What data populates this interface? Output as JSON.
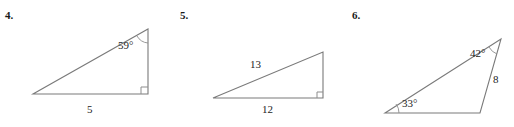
{
  "page": {
    "background_color": "#ffffff",
    "stroke_color": "#7a7a7a",
    "text_color": "#242424"
  },
  "problems": [
    {
      "number": "4.",
      "figure": {
        "shape": "right-triangle",
        "vertices": {
          "bottom_left": [
            33,
            94
          ],
          "bottom_right": [
            148,
            94
          ],
          "top_right": [
            148,
            29
          ]
        },
        "right_angle_at": "bottom_right",
        "labels": [
          {
            "name": "angle-label-59",
            "text": "59°",
            "x": 118,
            "y": 40,
            "kind": "angle"
          },
          {
            "name": "side-label-5",
            "text": "5",
            "x": 87,
            "y": 104,
            "kind": "length"
          }
        ]
      }
    },
    {
      "number": "5.",
      "figure": {
        "shape": "right-triangle",
        "vertices": {
          "bottom_left": [
            213,
            98
          ],
          "bottom_right": [
            323,
            98
          ],
          "top_right": [
            323,
            52
          ]
        },
        "right_angle_at": "bottom_right",
        "labels": [
          {
            "name": "side-label-13",
            "text": "13",
            "x": 250,
            "y": 59,
            "kind": "length"
          },
          {
            "name": "side-label-12",
            "text": "12",
            "x": 262,
            "y": 104,
            "kind": "length"
          }
        ]
      }
    },
    {
      "number": "6.",
      "figure": {
        "shape": "scalene-triangle",
        "vertices": {
          "bottom_left": [
            385,
            113
          ],
          "bottom_right": [
            480,
            113
          ],
          "top_right": [
            501,
            39
          ]
        },
        "right_angle_at": "none",
        "labels": [
          {
            "name": "angle-label-42",
            "text": "42°",
            "x": 470,
            "y": 48,
            "kind": "angle"
          },
          {
            "name": "side-label-8",
            "text": "8",
            "x": 493,
            "y": 74,
            "kind": "length"
          },
          {
            "name": "angle-label-33",
            "text": "33°",
            "x": 402,
            "y": 98,
            "kind": "angle"
          }
        ]
      }
    }
  ]
}
